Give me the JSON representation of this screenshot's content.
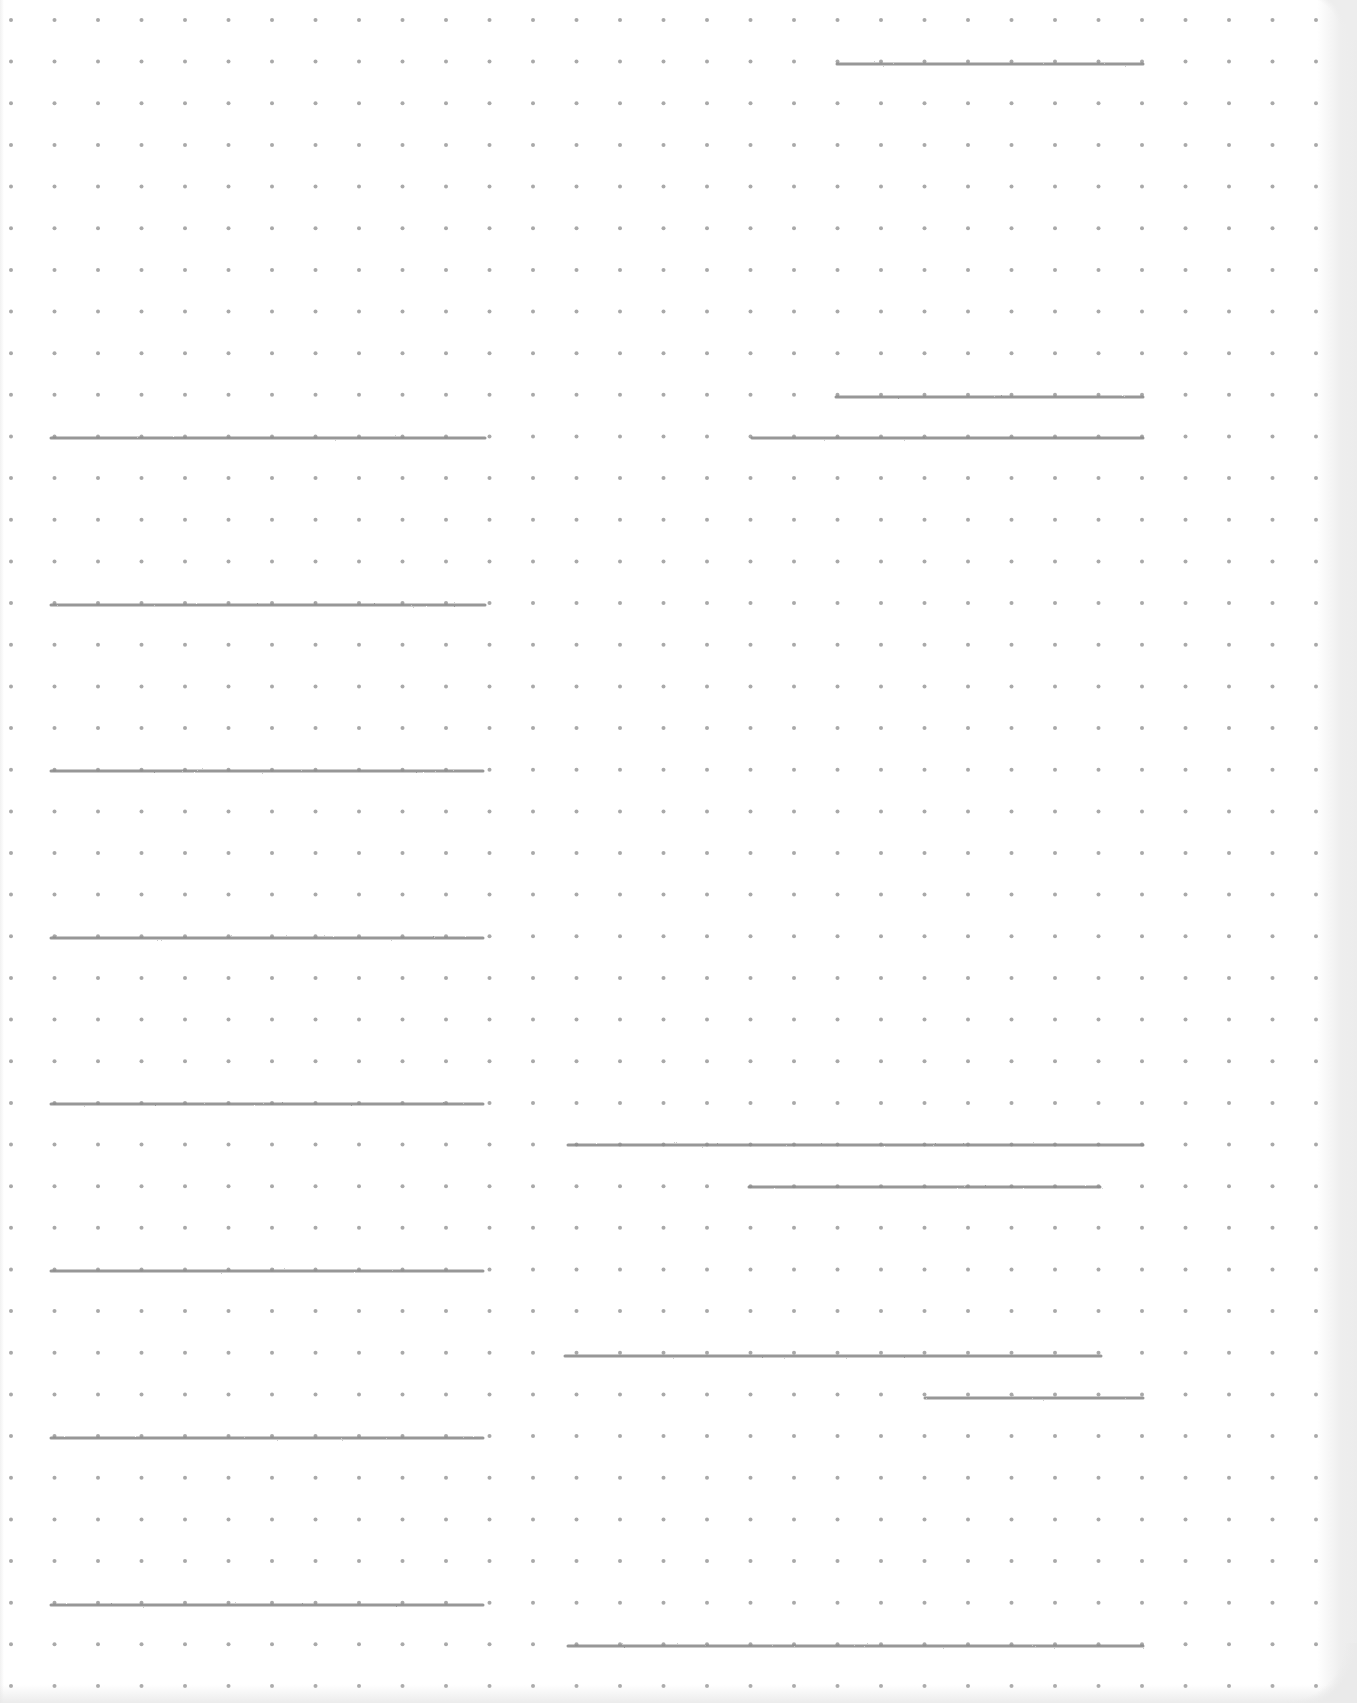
{
  "page": {
    "type": "dot-grid notebook page",
    "background_color": "#ffffff",
    "dot_color": "#a9a9a9",
    "line_color": "#8c8c8c"
  },
  "dot_grid": {
    "origin_x": 11,
    "origin_y": 20,
    "spacing_x": 43.5,
    "spacing_y": 41.65,
    "columns": 31,
    "rows": 41,
    "dot_radius": 2
  },
  "ruled_lines": {
    "left_column": [
      {
        "y": 438,
        "x1": 51,
        "x2": 485
      },
      {
        "y": 605,
        "x1": 51,
        "x2": 485
      },
      {
        "y": 771,
        "x1": 51,
        "x2": 483
      },
      {
        "y": 938,
        "x1": 51,
        "x2": 483
      },
      {
        "y": 1104,
        "x1": 51,
        "x2": 483
      },
      {
        "y": 1271,
        "x1": 51,
        "x2": 483
      },
      {
        "y": 1438,
        "x1": 51,
        "x2": 483
      },
      {
        "y": 1605,
        "x1": 51,
        "x2": 483
      }
    ],
    "right_column": [
      {
        "y": 64,
        "x1": 837,
        "x2": 1143
      },
      {
        "y": 397,
        "x1": 836,
        "x2": 1143
      },
      {
        "y": 438,
        "x1": 752,
        "x2": 1143
      },
      {
        "y": 1145,
        "x1": 568,
        "x2": 1143
      },
      {
        "y": 1187,
        "x1": 749,
        "x2": 1100
      },
      {
        "y": 1356,
        "x1": 565,
        "x2": 1101
      },
      {
        "y": 1398,
        "x1": 925,
        "x2": 1143
      },
      {
        "y": 1646,
        "x1": 568,
        "x2": 1143
      }
    ]
  }
}
